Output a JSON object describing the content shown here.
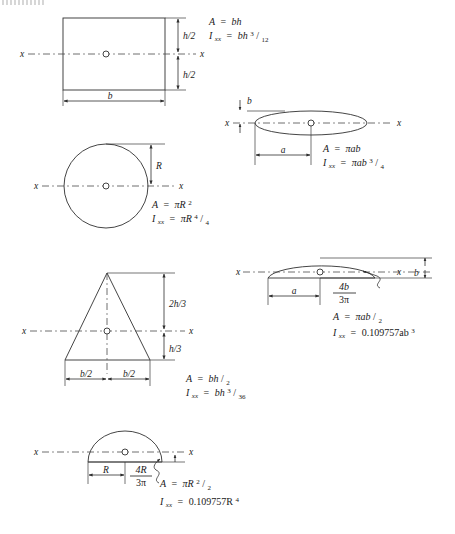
{
  "page": {
    "background_color": "#ffffff",
    "line_color": "#303030"
  },
  "axis_label": "x",
  "symbols": {
    "pi": "π",
    "equals": "=",
    "slash": "/"
  },
  "figures": [
    {
      "id": "rectangle",
      "name": "rectangle",
      "dimensions": [
        {
          "label": "h/2",
          "position": "upper-right"
        },
        {
          "label": "h/2",
          "position": "lower-right"
        },
        {
          "label": "b",
          "position": "bottom"
        }
      ],
      "formulas": [
        {
          "lhs": "A",
          "rhs": "bh"
        },
        {
          "lhs": "I",
          "lhs_sub": "xx",
          "rhs": "bh",
          "rhs_sup": "3",
          "denominator": "12"
        }
      ],
      "formula_text": [
        "A = bh",
        "Ixx = bh3/12"
      ]
    },
    {
      "id": "ellipse",
      "name": "ellipse",
      "dimensions": [
        {
          "label": "b",
          "position": "top-left"
        },
        {
          "label": "a",
          "position": "bottom"
        }
      ],
      "formulas": [
        {
          "lhs": "A",
          "rhs": "πab"
        },
        {
          "lhs": "I",
          "lhs_sub": "xx",
          "rhs": "πab",
          "rhs_sup": "3",
          "denominator": "4"
        }
      ],
      "formula_text": [
        "A = πab",
        "Ixx = πab3/4"
      ]
    },
    {
      "id": "circle",
      "name": "circle",
      "dimensions": [
        {
          "label": "R",
          "position": "right"
        }
      ],
      "formulas": [
        {
          "lhs": "A",
          "rhs": "πR",
          "rhs_sup": "2"
        },
        {
          "lhs": "I",
          "lhs_sub": "xx",
          "rhs": "πR",
          "rhs_sup": "4",
          "denominator": "4"
        }
      ],
      "formula_text": [
        "A = πR2",
        "Ixx = πR4/4"
      ]
    },
    {
      "id": "triangle",
      "name": "triangle",
      "dimensions": [
        {
          "label": "2h/3",
          "position": "upper-right"
        },
        {
          "label": "h/3",
          "position": "lower-right"
        },
        {
          "label": "b/2",
          "position": "bottom-left"
        },
        {
          "label": "b/2",
          "position": "bottom-right"
        }
      ],
      "formulas": [
        {
          "lhs": "A",
          "rhs": "bh",
          "denominator": "2"
        },
        {
          "lhs": "I",
          "lhs_sub": "xx",
          "rhs": "bh",
          "rhs_sup": "3",
          "denominator": "36"
        }
      ],
      "formula_text": [
        "A = bh/2",
        "Ixx = bh3/36"
      ]
    },
    {
      "id": "half-ellipse",
      "name": "half-ellipse",
      "dimensions": [
        {
          "label": "a",
          "position": "bottom"
        },
        {
          "label": "b",
          "position": "far-right"
        }
      ],
      "centroid_offset": {
        "numerator": "4b",
        "denominator": "3π"
      },
      "formulas": [
        {
          "lhs": "A",
          "rhs": "πab",
          "denominator": "2"
        },
        {
          "lhs": "I",
          "lhs_sub": "xx",
          "rhs": "0.109757ab",
          "rhs_sup": "3"
        }
      ],
      "formula_text": [
        "A = πab/2",
        "Ixx = 0.109757ab3"
      ]
    },
    {
      "id": "semicircle",
      "name": "semicircle",
      "dimensions": [
        {
          "label": "R",
          "position": "bottom"
        }
      ],
      "centroid_offset": {
        "numerator": "4R",
        "denominator": "3π"
      },
      "formulas": [
        {
          "lhs": "A",
          "rhs": "πR",
          "rhs_sup": "2",
          "denominator": "2"
        },
        {
          "lhs": "I",
          "lhs_sub": "xx",
          "rhs": "0.109757R",
          "rhs_sup": "4"
        }
      ],
      "formula_text": [
        "A = πR2/2",
        "Ixx = 0.109757R4"
      ]
    }
  ]
}
